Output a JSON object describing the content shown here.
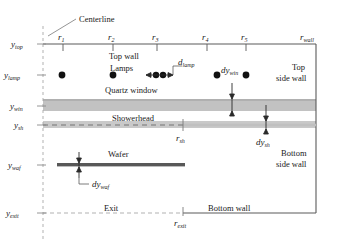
{
  "figure": {
    "type": "technical-cross-section-diagram",
    "background": "#ffffff",
    "line_color": "#4a4a4a",
    "dash_color": "#9a9a9a",
    "band_color": "#bfbfbf",
    "wafer_color": "#5a5a5a",
    "lamp_color": "#111111"
  },
  "callouts": {
    "centerline": "Centerline"
  },
  "radial_labels": [
    {
      "id": "r1",
      "text": "r",
      "sub": "1",
      "x": 63
    },
    {
      "id": "r2",
      "text": "r",
      "sub": "2",
      "x": 113
    },
    {
      "id": "r3",
      "text": "r",
      "sub": "3",
      "x": 157
    },
    {
      "id": "r4",
      "text": "r",
      "sub": "4",
      "x": 207
    },
    {
      "id": "r5",
      "text": "r",
      "sub": "5",
      "x": 246
    },
    {
      "id": "rwall",
      "text": "r",
      "sub": "wall",
      "x": 316
    }
  ],
  "axial_labels": [
    {
      "id": "ytop",
      "text": "y",
      "sub": "top",
      "y": 44
    },
    {
      "id": "ylamp",
      "text": "y",
      "sub": "lamp",
      "y": 75
    },
    {
      "id": "ywin",
      "text": "y",
      "sub": "win",
      "y": 112
    },
    {
      "id": "ysh",
      "text": "y",
      "sub": "sh",
      "y": 126
    },
    {
      "id": "ywaf",
      "text": "y",
      "sub": "waf",
      "y": 165
    },
    {
      "id": "yexit",
      "text": "y",
      "sub": "exit",
      "y": 213
    }
  ],
  "inner_labels": {
    "top_wall": "Top wall",
    "lamps": "Lamps",
    "quartz_window": "Quartz window",
    "showerhead": "Showerhead",
    "wafer": "Wafer",
    "exit": "Exit",
    "bottom_wall": "Bottom wall",
    "top_side_wall_line1": "Top",
    "top_side_wall_line2": "side wall",
    "bottom_side_wall_line1": "Bottom",
    "bottom_side_wall_line2": "side wall"
  },
  "dimensions": [
    {
      "id": "dlamp",
      "text": "d",
      "sub": "lamp"
    },
    {
      "id": "dywin",
      "text": "dy",
      "sub": "win"
    },
    {
      "id": "dysh",
      "text": "dy",
      "sub": "sh"
    },
    {
      "id": "dywaf",
      "text": "dy",
      "sub": "waf"
    }
  ],
  "feature_marks": [
    {
      "id": "rsh",
      "text": "r",
      "sub": "sh",
      "x": 183
    },
    {
      "id": "rexit",
      "text": "r",
      "sub": "exit",
      "x": 183
    }
  ],
  "lamps": {
    "count": 6,
    "x_positions": [
      62,
      113,
      156,
      163,
      217,
      246
    ],
    "y": 75
  },
  "geometry": {
    "centerline_x": 43,
    "wall_x": 316,
    "y_top": 44,
    "y_lamp": 75,
    "y_win_top": 99,
    "y_win_bottom": 112,
    "y_sh_top": 122,
    "y_sh_bottom": 128,
    "y_waf": 165,
    "y_exit": 213,
    "wafer_x_start": 57,
    "wafer_x_end": 185,
    "r_sh_x": 183,
    "r_exit_x": 183
  }
}
